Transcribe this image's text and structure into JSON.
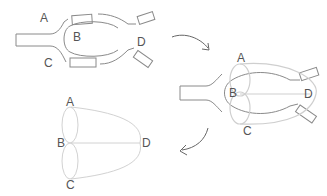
{
  "panels": {
    "map": {
      "labels": {
        "A": "A",
        "B": "B",
        "C": "C",
        "D": "D"
      }
    },
    "overlay": {
      "labels": {
        "A": "A",
        "B": "B",
        "C": "C",
        "D": "D"
      }
    },
    "graph": {
      "labels": {
        "A": "A",
        "B": "B",
        "C": "C",
        "D": "D"
      },
      "nodes": [
        "A",
        "B",
        "C",
        "D"
      ],
      "edges": [
        [
          "A",
          "B"
        ],
        [
          "A",
          "B"
        ],
        [
          "B",
          "C"
        ],
        [
          "B",
          "C"
        ],
        [
          "A",
          "D"
        ],
        [
          "B",
          "D"
        ],
        [
          "C",
          "D"
        ]
      ]
    }
  },
  "colors": {
    "stroke": "#888888",
    "overlay": "#cfcfcf",
    "text": "#555555"
  }
}
